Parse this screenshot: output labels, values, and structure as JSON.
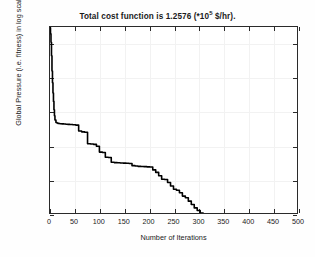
{
  "chart_data": {
    "type": "line",
    "title_prefix": "Total cost function is  1.2576 (*10",
    "title_exponent": "5",
    "title_suffix": " $/hr).",
    "xlabel": "Number of Iterations",
    "ylabel": "Global Pressure (i.e. fitness) in log scale",
    "xlim": [
      0,
      500
    ],
    "ylim": [
      1.26,
      1.37
    ],
    "xticks": [
      0,
      50,
      100,
      150,
      200,
      250,
      300,
      350,
      400,
      450,
      500
    ],
    "xtick_labels": [
      "0",
      "50",
      "100",
      "150",
      "200",
      "250",
      "300",
      "350",
      "400",
      "450",
      "500"
    ],
    "yticks": [
      1.26,
      1.28,
      1.3,
      1.32,
      1.34,
      1.36
    ],
    "ytick_labels": [
      "1.26",
      "1.28",
      "1.3",
      "1.32",
      "1.34",
      "1.36"
    ],
    "grid": false,
    "legend": null,
    "line_color": "#000000",
    "line_width": 1.6,
    "final_value": 1.2576,
    "series": [
      {
        "name": "Global Pressure",
        "x": [
          0,
          1,
          2,
          3,
          4,
          5,
          6,
          7,
          8,
          9,
          10,
          12,
          14,
          16,
          18,
          20,
          24,
          28,
          32,
          36,
          40,
          46,
          52,
          58,
          64,
          70,
          76,
          82,
          88,
          94,
          100,
          106,
          112,
          118,
          124,
          130,
          136,
          142,
          148,
          154,
          160,
          166,
          172,
          178,
          184,
          190,
          196,
          202,
          208,
          214,
          220,
          226,
          232,
          238,
          244,
          250,
          256,
          262,
          268,
          274,
          280,
          286,
          292,
          298,
          304,
          310,
          316,
          322,
          328,
          334,
          340,
          360,
          380,
          400,
          420,
          440,
          460,
          480,
          500
        ],
        "y": [
          1.3695,
          1.366,
          1.361,
          1.353,
          1.344,
          1.337,
          1.331,
          1.326,
          1.321,
          1.3175,
          1.315,
          1.3135,
          1.3132,
          1.313,
          1.3129,
          1.3128,
          1.3127,
          1.3126,
          1.3125,
          1.3124,
          1.3123,
          1.3122,
          1.312,
          1.3085,
          1.308,
          1.3078,
          1.301,
          1.3008,
          1.3006,
          1.2995,
          1.296,
          1.2958,
          1.293,
          1.2928,
          1.29,
          1.2898,
          1.2897,
          1.2896,
          1.2895,
          1.2894,
          1.2893,
          1.288,
          1.2878,
          1.2876,
          1.2875,
          1.2874,
          1.2873,
          1.2872,
          1.2855,
          1.284,
          1.282,
          1.28,
          1.2798,
          1.278,
          1.276,
          1.274,
          1.2735,
          1.272,
          1.27,
          1.269,
          1.267,
          1.265,
          1.263,
          1.2615,
          1.26,
          1.259,
          1.2582,
          1.2578,
          1.2576,
          1.2576,
          1.2576,
          1.2576,
          1.2576,
          1.2576,
          1.2576,
          1.2576,
          1.2576,
          1.2576,
          1.2576
        ]
      }
    ]
  }
}
